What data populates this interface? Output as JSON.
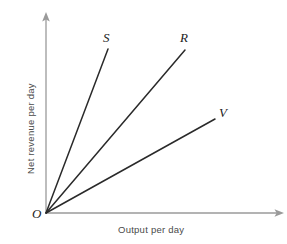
{
  "figure": {
    "background_color": "#ffffff",
    "axis_color": "#9a9a9a",
    "line_color": "#2a2a2a",
    "label_color": "#1c1c1c",
    "axis_title_color": "#4a4a4a",
    "origin_label": "O"
  },
  "axes": {
    "x_title": "Output per day",
    "y_title": "Net revenue per day"
  },
  "chart_data": {
    "type": "line",
    "title": "",
    "subtitle": "",
    "xlabel": "Output per day",
    "ylabel": "Net revenue per day",
    "xlim": [
      0,
      1
    ],
    "ylim": [
      0,
      1
    ],
    "grid": false,
    "legend": "inline-end-labels",
    "annotations": [
      "O"
    ],
    "origin": {
      "label": "O",
      "x": 0,
      "y": 0
    },
    "series": [
      {
        "name": "S",
        "label": "S",
        "slope": 2.65,
        "x": [
          0,
          0.262
        ],
        "y": [
          0,
          0.821
        ],
        "px_start": [
          46,
          213
        ],
        "px_end": [
          108,
          49
        ]
      },
      {
        "name": "R",
        "label": "R",
        "slope": 1.17,
        "x": [
          0,
          0.586
        ],
        "y": [
          0,
          0.816
        ],
        "px_start": [
          46,
          213
        ],
        "px_end": [
          185,
          50
        ]
      },
      {
        "name": "V",
        "label": "V",
        "slope": 0.56,
        "x": [
          0,
          0.713
        ],
        "y": [
          0,
          0.47
        ],
        "px_start": [
          46,
          213
        ],
        "px_end": [
          215,
          119
        ]
      }
    ]
  },
  "labels": {
    "s": "S",
    "r": "R",
    "v": "V"
  }
}
